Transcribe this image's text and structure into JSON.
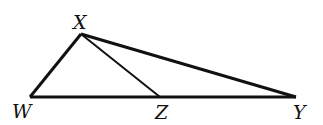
{
  "diagram": {
    "points": {
      "X": {
        "label": "X",
        "x": 81,
        "y": 34
      },
      "W": {
        "label": "W",
        "x": 30,
        "y": 97
      },
      "Z": {
        "label": "Z",
        "x": 160,
        "y": 97
      },
      "Y": {
        "label": "Y",
        "x": 296,
        "y": 97
      }
    },
    "segments": [
      "XW",
      "XZ",
      "XY",
      "WY"
    ],
    "stroke_color": "#111111"
  }
}
